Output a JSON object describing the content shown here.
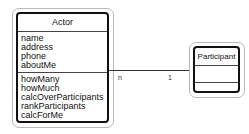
{
  "diagram": {
    "classes": [
      {
        "name": "Actor",
        "attributes": [
          "name",
          "address",
          "phone",
          "aboutMe"
        ],
        "operations": [
          "howMany",
          "howMuch",
          "calcOverParticipants",
          "rankParticipants",
          "calcForMe"
        ]
      },
      {
        "name": "Participant",
        "attributes": [],
        "operations": []
      }
    ],
    "association": {
      "from": "Actor",
      "to": "Participant",
      "from_multiplicity": "n",
      "to_multiplicity": "1"
    },
    "colors": {
      "border": "#111111",
      "outer_frame": "#b8b8b8",
      "background": "#ffffff"
    }
  }
}
